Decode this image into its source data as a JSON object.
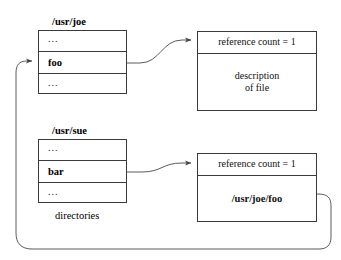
{
  "diagram": {
    "stroke_color": "#3a3a3a",
    "background": "#ffffff",
    "caption_directories": "directories",
    "directories": [
      {
        "name": "directory-usr-joe",
        "label": "/usr/joe",
        "rows": [
          {
            "text": "...",
            "kind": "ellipsis"
          },
          {
            "text": "foo",
            "kind": "entry"
          },
          {
            "text": "...",
            "kind": "ellipsis"
          }
        ]
      },
      {
        "name": "directory-usr-sue",
        "label": "/usr/sue",
        "rows": [
          {
            "text": "...",
            "kind": "ellipsis"
          },
          {
            "text": "bar",
            "kind": "entry"
          },
          {
            "text": "...",
            "kind": "ellipsis"
          }
        ]
      }
    ],
    "inodes": [
      {
        "name": "inode-file",
        "header": "reference count = 1",
        "body_lines": [
          "description",
          "of file"
        ],
        "body_bold": false
      },
      {
        "name": "inode-symlink",
        "header": "reference count = 1",
        "body_lines": [
          "/usr/joe/foo"
        ],
        "body_bold": true
      }
    ],
    "connectors": [
      {
        "name": "link-foo-to-inode",
        "from": "foo",
        "to": "inode-file"
      },
      {
        "name": "link-bar-to-symlink",
        "from": "bar",
        "to": "inode-symlink"
      },
      {
        "name": "link-symlink-target-to-foo",
        "from": "inode-symlink",
        "to": "foo"
      }
    ]
  }
}
